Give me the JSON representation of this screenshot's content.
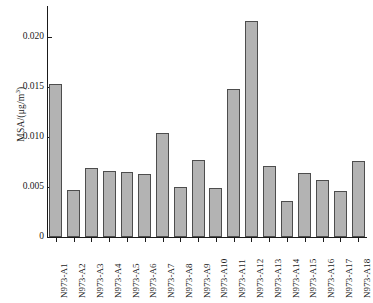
{
  "chart_data": {
    "type": "bar",
    "title": "",
    "xlabel": "",
    "ylabel": "MSA/(μg/m³)",
    "ylabel_parts": {
      "prefix": "MSA/(μg/m",
      "sup": "3",
      "suffix": ")"
    },
    "ylim": [
      0,
      0.0225
    ],
    "yticks": [
      0,
      0.005,
      0.01,
      0.015,
      0.02
    ],
    "ytick_labels": [
      "0",
      "0.005",
      "0.010",
      "0.015",
      "0.020"
    ],
    "grid": false,
    "legend": null,
    "categories": [
      "N973-A1",
      "N973-A2",
      "N973-A3",
      "N973-A4",
      "N973-A5",
      "N973-A6",
      "N973-A7",
      "N973-A8",
      "N973-A9",
      "N973-A10",
      "N973-A11",
      "N973-A12",
      "N973-A13",
      "N973-A14",
      "N973-A15",
      "N973-A16",
      "N973-A17",
      "N973-A18"
    ],
    "values": [
      0.0153,
      0.0047,
      0.0069,
      0.0066,
      0.0065,
      0.0063,
      0.0104,
      0.005,
      0.0077,
      0.0049,
      0.0148,
      0.0216,
      0.0071,
      0.0036,
      0.0064,
      0.0057,
      0.0046,
      0.0076
    ],
    "bar_color": "#b3b3b3",
    "bar_edge_color": "#4d4d4d",
    "axis_color": "#1a1a1a"
  }
}
